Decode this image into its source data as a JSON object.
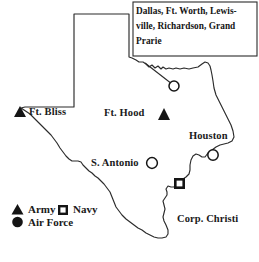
{
  "figure": {
    "type": "thematic-map",
    "region": "Texas",
    "background_color": "#ffffff",
    "line_color": "#2b2b2b"
  },
  "callout": {
    "text": "Dallas, Ft. Worth,  Lewis-ville, Richardson, Grand Prarie",
    "lines": [
      "Dallas, Ft. Worth,  Lewis-",
      "ville, Richardson, Grand",
      "Prarie"
    ]
  },
  "places": [
    {
      "label": "Ft. Bliss",
      "marker": "triangle",
      "branch": "Army"
    },
    {
      "label": "Ft. Hood",
      "marker": "triangle",
      "branch": "Army"
    },
    {
      "label": "Houston",
      "marker": "circle",
      "branch": "Air Force"
    },
    {
      "label": "S. Antonio",
      "marker": "circle",
      "branch": "Air Force"
    },
    {
      "label": "Corp. Christi",
      "marker": "square",
      "branch": "Navy"
    }
  ],
  "dfw_marker": {
    "marker": "circle",
    "branch": "Air Force"
  },
  "legend": {
    "items": [
      {
        "marker": "triangle",
        "label": "Army"
      },
      {
        "marker": "square",
        "label": "Navy"
      },
      {
        "marker": "circle",
        "label": "Air Force"
      }
    ]
  }
}
